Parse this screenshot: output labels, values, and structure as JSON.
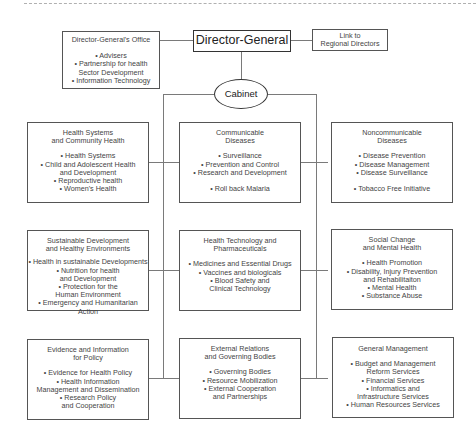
{
  "diagram": {
    "type": "org-chart",
    "top": {
      "director_general": "Director-General",
      "link_regional": "Link to\nRegional Directors",
      "cabinet": "Cabinet",
      "dg_office": {
        "title": "Director-General's Office",
        "items": [
          "• Advisers",
          "• Partnership for health\nSector Development",
          "• Information Technology"
        ]
      }
    },
    "clusters": [
      {
        "title": "Health Systems\nand Community Health",
        "items": [
          "• Health Systems",
          "• Child and Adolescent Health\nand Development",
          "• Reproductive health",
          "• Women's Health"
        ]
      },
      {
        "title": "Communicable\nDiseases",
        "items": [
          "• Surveillance",
          "• Prevention and Control",
          "• Research and Development"
        ],
        "extra": "• Roll back Malaria"
      },
      {
        "title": "Noncommunicable\nDiseases",
        "items": [
          "• Disease Prevention",
          "• Disease Management",
          "• Disease Surveillance"
        ],
        "extra": "• Tobacco Free Initiative"
      },
      {
        "title": "Sustainable Development\nand Healthy Environments",
        "items": [
          "• Health in sustainable Developments",
          "• Nutrition for health\nand Development",
          "• Protection for the\nHuman Environment",
          "• Emergency and Humanitarian Action"
        ]
      },
      {
        "title": "Health Technology and\nPharmaceuticals",
        "items": [
          "• Medicines and Essential Drugs",
          "• Vaccines and biologicals",
          "• Blood Safety and\nClinical Technology"
        ]
      },
      {
        "title": "Social Change\nand Mental Health",
        "items": [
          "• Health Promotion",
          "• Disability, Injury Prevention\nand Rehabilitaiton",
          "• Mental Health",
          "• Substance Abuse"
        ]
      },
      {
        "title": "Evidence and Information\nfor Policy",
        "items": [
          "• Evidence for Health Policy",
          "• Health Information\nManagement and Dissemination",
          "• Research Policy\nand Cooperation"
        ]
      },
      {
        "title": "External Relations\nand Governing Bodies",
        "items": [
          "• Governing Bodies",
          "• Resource Mobilization",
          "• External Cooperation\nand Partnerships"
        ]
      },
      {
        "title": "General Management",
        "items": [
          "• Budget and Management\nReform Services",
          "• Financial Services",
          "• Informatics and\nInfrastructure Services",
          "• Human Resources Services"
        ]
      }
    ]
  }
}
